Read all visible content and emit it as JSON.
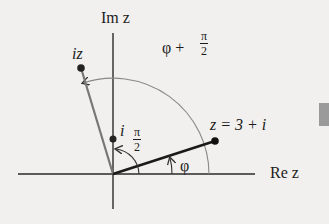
{
  "axes": {
    "imaginary_label": "Im z",
    "real_label": "Re z"
  },
  "points": {
    "z": {
      "label": "z = 3 + i",
      "x": 3,
      "y": 1
    },
    "iz": {
      "label": "iz",
      "x": -1,
      "y": 3
    },
    "i": {
      "label": "i",
      "x": 0,
      "y": 1
    }
  },
  "angles": {
    "phi": "φ",
    "phi_plus_half_pi": {
      "prefix": "φ +",
      "num": "π",
      "den": "2"
    },
    "half_pi": {
      "num": "π",
      "den": "2"
    }
  },
  "colors": {
    "background": "#f1f0ee",
    "ink": "#1c1c1c",
    "gray_line": "#7a7a7a",
    "side_tab": "#9a9a9a"
  }
}
